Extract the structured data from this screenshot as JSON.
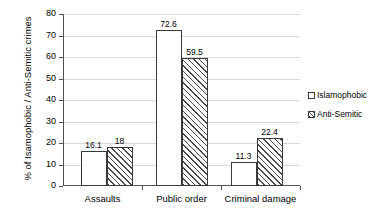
{
  "chart_data": {
    "type": "bar",
    "title": "",
    "xlabel": "",
    "ylabel": "% of Isamophobic / Anti-Semitic crimes",
    "ylim": [
      0,
      80
    ],
    "ytick_step": 10,
    "yticks": [
      0,
      10,
      20,
      30,
      40,
      50,
      60,
      70,
      80
    ],
    "ytick_labels": [
      "0",
      "10",
      "20",
      "30",
      "40",
      "50",
      "60",
      "70",
      "80"
    ],
    "grid": true,
    "grid_axis": "y",
    "legend_position": "right",
    "categories": [
      "Assaults",
      "Public order",
      "Criminal damage"
    ],
    "series": [
      {
        "name": "Islamophobic",
        "pattern": "dotted",
        "values": [
          16.1,
          72.6,
          11.3
        ],
        "labels": [
          "16.1",
          "72.6",
          "11.3"
        ]
      },
      {
        "name": "Anti-Semitic",
        "pattern": "diagonal-hatch",
        "values": [
          18,
          59.5,
          22.4
        ],
        "labels": [
          "18",
          "59.5",
          "22.4"
        ]
      }
    ],
    "colors": {
      "bar_outline": "#3a3a3a",
      "gridline": "#d8d8d8",
      "axis": "#555555",
      "text": "#000000",
      "background": "#ffffff"
    }
  },
  "legend": {
    "items": [
      {
        "label": "Islamophobic",
        "pattern": "dotted"
      },
      {
        "label": "Anti-Semitic",
        "pattern": "diagonal-hatch"
      }
    ]
  }
}
